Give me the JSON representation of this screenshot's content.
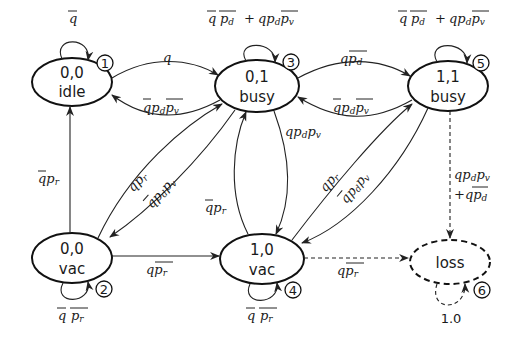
{
  "diagram": {
    "type": "state-transition (Markov chain)",
    "nodes": [
      {
        "id": 1,
        "state": "0,0",
        "mode": "idle",
        "self_loop": "q̄"
      },
      {
        "id": 2,
        "state": "0,0",
        "mode": "vac",
        "self_loop": "q̄ p̄r"
      },
      {
        "id": 3,
        "state": "0,1",
        "mode": "busy",
        "self_loop": "q̄ p̄d + q pd p̄v"
      },
      {
        "id": 4,
        "state": "1,0",
        "mode": "vac",
        "self_loop": "q̄ p̄r"
      },
      {
        "id": 5,
        "state": "1,1",
        "mode": "busy",
        "self_loop": "q̄ p̄d + q pd p̄v"
      },
      {
        "id": 6,
        "state": "loss",
        "mode": "",
        "self_loop": "1.0"
      }
    ],
    "edges": [
      {
        "from": 1,
        "to": 3,
        "label": "q"
      },
      {
        "from": 3,
        "to": 1,
        "label": "q̄ pd p̄v"
      },
      {
        "from": 3,
        "to": 5,
        "label": "q p̄d"
      },
      {
        "from": 5,
        "to": 3,
        "label": "q̄ pd p̄v"
      },
      {
        "from": 2,
        "to": 1,
        "label": "q̄ pr"
      },
      {
        "from": 2,
        "to": 3,
        "label": "q pr"
      },
      {
        "from": 3,
        "to": 2,
        "label": "q̄ pd pv"
      },
      {
        "from": 3,
        "to": 4,
        "label": "q pd pv"
      },
      {
        "from": 4,
        "to": 3,
        "label": "q̄ pr"
      },
      {
        "from": 2,
        "to": 4,
        "label": "q p̄r"
      },
      {
        "from": 4,
        "to": 5,
        "label": "q pr"
      },
      {
        "from": 5,
        "to": 4,
        "label": "q̄ pd pv"
      },
      {
        "from": 4,
        "to": 6,
        "label": "q p̄r",
        "style": "dashed"
      },
      {
        "from": 5,
        "to": 6,
        "label": "q pd pv + q p̄d",
        "style": "dashed"
      }
    ]
  },
  "labels": {
    "n1_state": "0,0",
    "n1_mode": "idle",
    "n1_num": "1",
    "n2_state": "0,0",
    "n2_mode": "vac",
    "n2_num": "2",
    "n3_state": "0,1",
    "n3_mode": "busy",
    "n3_num": "3",
    "n4_state": "1,0",
    "n4_mode": "vac",
    "n4_num": "4",
    "n5_state": "1,1",
    "n5_mode": "busy",
    "n5_num": "5",
    "n6_state": "loss",
    "n6_num": "6",
    "loop6": "1.0"
  }
}
